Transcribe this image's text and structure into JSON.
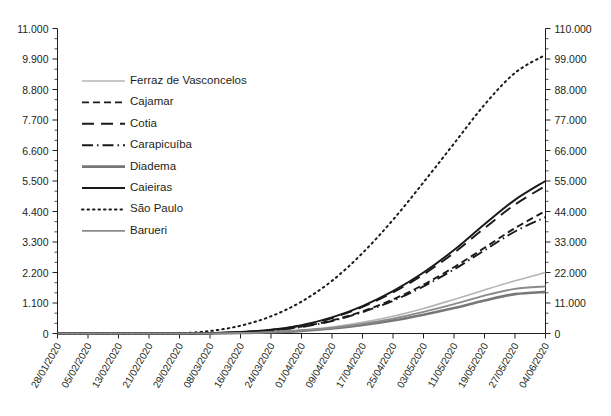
{
  "chart_data": {
    "type": "line",
    "title": "",
    "subtitle": "",
    "xlabel": "",
    "ylabel": "",
    "y2label": "",
    "grid": false,
    "legend_position": "upper-left-inside",
    "x": [
      "28/01/2020",
      "05/02/2020",
      "13/02/2020",
      "21/02/2020",
      "29/02/2020",
      "08/03/2020",
      "16/03/2020",
      "24/03/2020",
      "01/04/2020",
      "09/04/2020",
      "17/04/2020",
      "25/04/2020",
      "03/05/2020",
      "11/05/2020",
      "19/05/2020",
      "27/05/2020",
      "04/06/2020"
    ],
    "xtick_labels": [
      "28/01/2020",
      "05/02/2020",
      "13/02/2020",
      "21/02/2020",
      "29/02/2020",
      "08/03/2020",
      "16/03/2020",
      "24/03/2020",
      "01/04/2020",
      "09/04/2020",
      "17/04/2020",
      "25/04/2020",
      "03/05/2020",
      "11/05/2020",
      "19/05/2020",
      "27/05/2020",
      "04/06/2020"
    ],
    "ylim": [
      0,
      11000
    ],
    "ytick_labels": [
      "0",
      "1.100",
      "2.200",
      "3.300",
      "4.400",
      "5.500",
      "6.600",
      "7.700",
      "8.800",
      "9.900",
      "11.000"
    ],
    "ytick_values": [
      0,
      1100,
      2200,
      3300,
      4400,
      5500,
      6600,
      7700,
      8800,
      9900,
      11000
    ],
    "y2lim": [
      0,
      110000
    ],
    "y2tick_labels": [
      "0",
      "11.000",
      "22.000",
      "33.000",
      "44.000",
      "55.000",
      "66.000",
      "77.000",
      "88.000",
      "99.000",
      "110.000"
    ],
    "y2tick_values": [
      0,
      11000,
      22000,
      33000,
      44000,
      55000,
      66000,
      77000,
      88000,
      99000,
      110000
    ],
    "y_minor_per_major": 2,
    "series": [
      {
        "name": "Ferraz de Vasconcelos",
        "axis": "left",
        "style": "solid",
        "color": "#b4b4b4",
        "width": 1.6,
        "values": [
          0,
          0,
          0,
          0,
          0,
          5,
          20,
          55,
          120,
          230,
          400,
          620,
          900,
          1230,
          1570,
          1900,
          2200
        ]
      },
      {
        "name": "Cajamar",
        "axis": "left",
        "style": "dashed",
        "color": "#1a1a1a",
        "width": 1.9,
        "values": [
          0,
          0,
          0,
          0,
          0,
          10,
          40,
          110,
          250,
          470,
          800,
          1230,
          1760,
          2390,
          3090,
          3800,
          4420
        ]
      },
      {
        "name": "Cotia",
        "axis": "left",
        "style": "longdash",
        "color": "#1a1a1a",
        "width": 1.9,
        "values": [
          0,
          0,
          0,
          0,
          0,
          12,
          48,
          130,
          290,
          560,
          960,
          1480,
          2130,
          2910,
          3800,
          4650,
          5320
        ]
      },
      {
        "name": "Carapicuíba",
        "axis": "left",
        "style": "dashdot",
        "color": "#1a1a1a",
        "width": 1.9,
        "values": [
          0,
          0,
          0,
          0,
          0,
          9,
          38,
          105,
          235,
          450,
          770,
          1180,
          1700,
          2310,
          3000,
          3680,
          4200
        ]
      },
      {
        "name": "Diadema",
        "axis": "left",
        "style": "solid",
        "color": "#777777",
        "width": 2.6,
        "values": [
          0,
          0,
          0,
          0,
          0,
          4,
          16,
          44,
          96,
          180,
          305,
          470,
          680,
          920,
          1190,
          1420,
          1500
        ]
      },
      {
        "name": "Caieiras",
        "axis": "left",
        "style": "solid",
        "color": "#1a1a1a",
        "width": 2.0,
        "values": [
          0,
          0,
          0,
          0,
          0,
          12,
          50,
          135,
          300,
          580,
          990,
          1530,
          2200,
          3010,
          3940,
          4820,
          5500
        ]
      },
      {
        "name": "São Paulo",
        "axis": "right",
        "style": "dotted",
        "color": "#1a1a1a",
        "width": 2.0,
        "values": [
          0,
          0,
          0,
          0,
          100,
          900,
          2800,
          6200,
          11500,
          19000,
          29000,
          41000,
          54500,
          68500,
          82500,
          94000,
          100500
        ]
      },
      {
        "name": "Barueri",
        "axis": "left",
        "style": "solid",
        "color": "#8a8a8a",
        "width": 1.8,
        "values": [
          0,
          0,
          0,
          0,
          0,
          4,
          18,
          50,
          110,
          205,
          350,
          540,
          780,
          1060,
          1370,
          1610,
          1700
        ]
      }
    ]
  },
  "legend": {
    "items": [
      {
        "label": "Ferraz de Vasconcelos"
      },
      {
        "label": "Cajamar"
      },
      {
        "label": "Cotia"
      },
      {
        "label": "Carapicuíba"
      },
      {
        "label": "Diadema"
      },
      {
        "label": "Caieiras"
      },
      {
        "label": "São Paulo"
      },
      {
        "label": "Barueri"
      }
    ]
  }
}
